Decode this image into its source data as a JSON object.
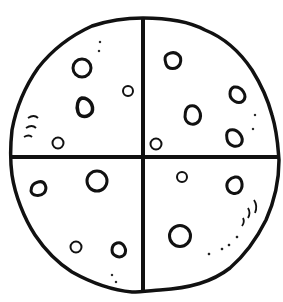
{
  "image": {
    "subject": "cookie divided into four quarters",
    "width": 283,
    "height": 302,
    "stroke_color": "#111111",
    "fill_color": "#ffffff"
  },
  "quarters": [
    {
      "name": "top-left",
      "chips": 4
    },
    {
      "name": "top-right",
      "chips": 5
    },
    {
      "name": "bottom-left",
      "chips": 4
    },
    {
      "name": "bottom-right",
      "chips": 3
    }
  ]
}
